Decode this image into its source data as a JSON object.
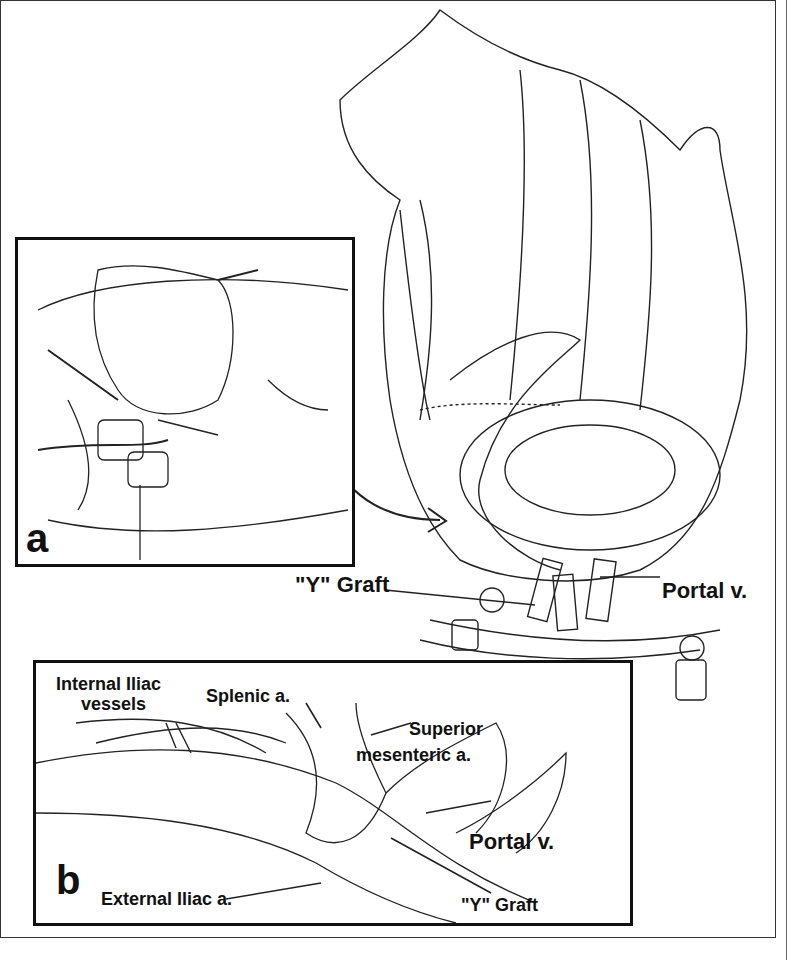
{
  "figure": {
    "panel_a": {
      "letter": "a"
    },
    "panel_b": {
      "letter": "b",
      "labels": {
        "internal_iliac": "Internal Iliac\nvessels",
        "internal_iliac_line1": "Internal Iliac",
        "internal_iliac_line2": "vessels",
        "splenic": "Splenic a.",
        "sma_line1": "Superior",
        "sma_line2": "mesenteric a.",
        "portal": "Portal v.",
        "external_iliac": "External Iliac a.",
        "y_graft": "\"Y\" Graft"
      }
    },
    "main": {
      "labels": {
        "y_graft": "\"Y\" Graft",
        "portal": "Portal v."
      }
    }
  }
}
